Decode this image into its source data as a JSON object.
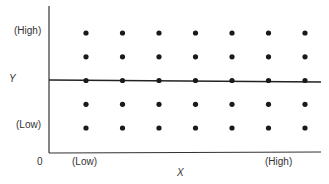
{
  "chart_data": {
    "type": "scatter",
    "title": "",
    "xlabel": "X",
    "ylabel": "Y",
    "origin_label": "0",
    "x_tick_labels": {
      "low": "(Low)",
      "high": "(High)"
    },
    "y_tick_labels": {
      "low": "(Low)",
      "high": "(High)"
    },
    "grid": false,
    "legend": null,
    "x": [
      1,
      2,
      3,
      4,
      5,
      6,
      7
    ],
    "y_levels": [
      1,
      2,
      3,
      4,
      5
    ],
    "points": [
      [
        1,
        1
      ],
      [
        2,
        1
      ],
      [
        3,
        1
      ],
      [
        4,
        1
      ],
      [
        5,
        1
      ],
      [
        6,
        1
      ],
      [
        7,
        1
      ],
      [
        1,
        2
      ],
      [
        2,
        2
      ],
      [
        3,
        2
      ],
      [
        4,
        2
      ],
      [
        5,
        2
      ],
      [
        6,
        2
      ],
      [
        7,
        2
      ],
      [
        1,
        3
      ],
      [
        2,
        3
      ],
      [
        3,
        3
      ],
      [
        4,
        3
      ],
      [
        5,
        3
      ],
      [
        6,
        3
      ],
      [
        7,
        3
      ],
      [
        1,
        4
      ],
      [
        2,
        4
      ],
      [
        3,
        4
      ],
      [
        4,
        4
      ],
      [
        5,
        4
      ],
      [
        6,
        4
      ],
      [
        7,
        4
      ],
      [
        1,
        5
      ],
      [
        2,
        5
      ],
      [
        3,
        5
      ],
      [
        4,
        5
      ],
      [
        5,
        5
      ],
      [
        6,
        5
      ],
      [
        7,
        5
      ]
    ],
    "regression_line": {
      "slope": 0,
      "intercept": 3,
      "description": "horizontal line through middle row (no relationship)"
    },
    "xlim": [
      0,
      8
    ],
    "ylim": [
      0,
      6
    ]
  },
  "labels": {
    "y_axis": "Y",
    "x_axis": "X",
    "origin": "0",
    "y_high": "(High)",
    "y_low": "(Low)",
    "x_low": "(Low)",
    "x_high": "(High)"
  },
  "colors": {
    "ink": "#1a1a1a",
    "axis": "#333333",
    "background": "#ffffff"
  }
}
